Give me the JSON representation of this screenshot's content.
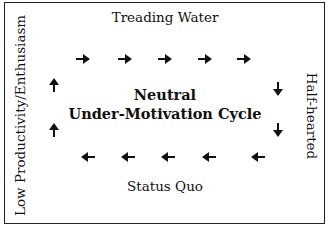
{
  "diagram": {
    "title": "Neutral",
    "subtitle": "Under-Motivation Cycle",
    "labels": {
      "top": "Treading Water",
      "bottom": "Status Quo",
      "left": "Low Productivity/Enthusiasm",
      "right": "Half-hearted"
    },
    "arrows": [
      {
        "dir": "right",
        "x": 75,
        "y": 51
      },
      {
        "dir": "right",
        "x": 117,
        "y": 51
      },
      {
        "dir": "right",
        "x": 157,
        "y": 51
      },
      {
        "dir": "right",
        "x": 197,
        "y": 51
      },
      {
        "dir": "right",
        "x": 236,
        "y": 51
      },
      {
        "dir": "down",
        "x": 270,
        "y": 81
      },
      {
        "dir": "down",
        "x": 270,
        "y": 122
      },
      {
        "dir": "left",
        "x": 250,
        "y": 149
      },
      {
        "dir": "left",
        "x": 201,
        "y": 149
      },
      {
        "dir": "left",
        "x": 160,
        "y": 149
      },
      {
        "dir": "left",
        "x": 120,
        "y": 149
      },
      {
        "dir": "left",
        "x": 80,
        "y": 149
      },
      {
        "dir": "up",
        "x": 46,
        "y": 122
      },
      {
        "dir": "up",
        "x": 46,
        "y": 77
      }
    ],
    "colors": {
      "line": "#222222",
      "text": "#111111",
      "background": "#ffffff"
    }
  }
}
